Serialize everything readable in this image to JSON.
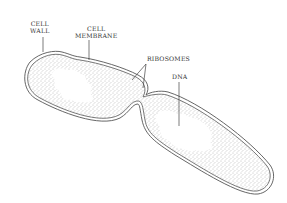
{
  "diagram": {
    "labels": {
      "cell_wall_line1": "CELL",
      "cell_wall_line2": "WALL",
      "cell_membrane_line1": "CELL",
      "cell_membrane_line2": "MEMBRANE",
      "ribosomes": "RIBOSOMES",
      "dna": "DNA"
    },
    "colors": {
      "outline": "#555555",
      "stipple": "#777777",
      "background": "#ffffff"
    }
  }
}
